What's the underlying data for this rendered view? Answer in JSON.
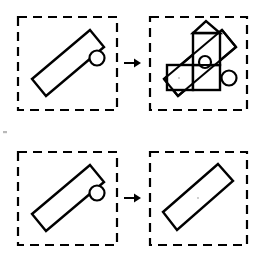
{
  "figure": {
    "background_color": "#ffffff",
    "ink_color": "#000000",
    "width": 259,
    "height": 255,
    "stroke_style": "black line art",
    "panel_border_style": "dashed square",
    "row_count": 2,
    "panels_per_row": 2
  },
  "rows": [
    {
      "id": "row-top",
      "label": "Top transformation row",
      "source_panel": {
        "id": "panel-top-left",
        "label": "Tilted rectangle with small circle at upper right edge",
        "frame": {
          "x": 18,
          "y": 17,
          "width": 99,
          "height": 93
        },
        "shapes": [
          {
            "type": "rotated-rectangle",
            "name": "tilted-bar",
            "points": "90,30 104,47 46,96 32,79",
            "angle_deg": -40
          },
          {
            "type": "circle",
            "name": "knob-circle",
            "cx": 97,
            "cy": 58,
            "r": 7.5
          }
        ]
      },
      "arrow": {
        "id": "arrow-top",
        "label": "transforms into",
        "glyph": "right-arrow",
        "x1": 124,
        "y1": 63,
        "x2": 139,
        "y2": 63
      },
      "target_panel": {
        "id": "panel-top-right",
        "label": "Tilted bar overlaid with axis-aligned squares and a diamond",
        "frame": {
          "x": 150,
          "y": 17,
          "width": 97,
          "height": 93
        },
        "shapes": [
          {
            "type": "rotated-rectangle",
            "name": "tilted-bar",
            "points": "222,30 236,47 178,96 164,79",
            "angle_deg": -40
          },
          {
            "type": "square",
            "name": "upper-square",
            "x": 193,
            "y": 33,
            "width": 27,
            "height": 32
          },
          {
            "type": "square",
            "name": "lower-right-square",
            "x": 193,
            "y": 65,
            "width": 27,
            "height": 25
          },
          {
            "type": "rectangle",
            "name": "lower-left-rectangle",
            "x": 167,
            "y": 65,
            "width": 26,
            "height": 25
          },
          {
            "type": "triangle",
            "name": "apex-triangle",
            "points": "193,33 220,33 206,21"
          },
          {
            "type": "circle",
            "name": "knob-circle",
            "cx": 229,
            "cy": 78,
            "r": 7.5
          },
          {
            "type": "circle",
            "name": "inner-small-circle",
            "cx": 205,
            "cy": 62,
            "r": 6.0
          }
        ]
      }
    },
    {
      "id": "row-bottom",
      "label": "Bottom transformation row",
      "source_panel": {
        "id": "panel-bottom-left",
        "label": "Tilted rectangle with small circle at upper right edge",
        "frame": {
          "x": 18,
          "y": 152,
          "width": 99,
          "height": 93
        },
        "shapes": [
          {
            "type": "rotated-rectangle",
            "name": "tilted-bar",
            "points": "90,165 104,182 46,231 32,214",
            "angle_deg": -40
          },
          {
            "type": "circle",
            "name": "knob-circle",
            "cx": 97,
            "cy": 193,
            "r": 7.5
          }
        ]
      },
      "arrow": {
        "id": "arrow-bottom",
        "label": "transforms into",
        "glyph": "right-arrow",
        "x1": 124,
        "y1": 198,
        "x2": 139,
        "y2": 198
      },
      "target_panel": {
        "id": "panel-bottom-right",
        "label": "Tilted rectangle alone, circle removed",
        "frame": {
          "x": 150,
          "y": 152,
          "width": 97,
          "height": 93
        },
        "shapes": [
          {
            "type": "rotated-rectangle",
            "name": "tilted-bar",
            "points": "218,164 233,181 177,230 163,212",
            "angle_deg": -40
          }
        ]
      }
    }
  ]
}
